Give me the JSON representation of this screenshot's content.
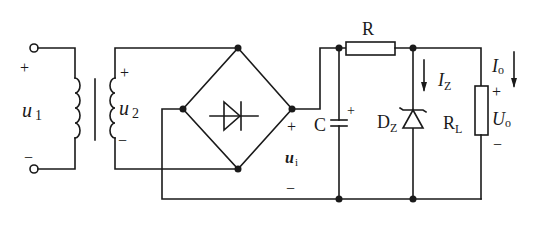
{
  "diagram": {
    "type": "circuit",
    "labels": {
      "u1": "u",
      "u1_sub": "1",
      "u2": "u",
      "u2_sub": "2",
      "ui": "u",
      "ui_sub": "i",
      "R": "R",
      "C": "C",
      "DZ": "D",
      "DZ_sub": "Z",
      "IZ": "I",
      "IZ_sub": "Z",
      "Io": "I",
      "Io_sub": "o",
      "RL": "R",
      "RL_sub": "L",
      "Uo": "U",
      "Uo_sub": "o",
      "plus": "+",
      "minus": "−"
    },
    "components": [
      {
        "id": "input-terminals",
        "kind": "terminal pair",
        "label": "u1"
      },
      {
        "id": "transformer",
        "kind": "transformer",
        "primary": "u1",
        "secondary": "u2"
      },
      {
        "id": "bridge",
        "kind": "bridge rectifier"
      },
      {
        "id": "C",
        "kind": "polarized capacitor"
      },
      {
        "id": "R",
        "kind": "resistor"
      },
      {
        "id": "DZ",
        "kind": "zener diode",
        "current": "IZ"
      },
      {
        "id": "RL",
        "kind": "load resistor",
        "current": "Io",
        "voltage": "Uo"
      }
    ],
    "colors": {
      "stroke": "#1a1a1a",
      "background": "#ffffff"
    }
  }
}
